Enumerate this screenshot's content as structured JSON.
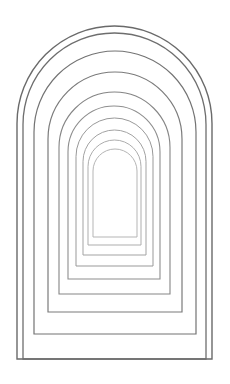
{
  "image": {
    "subject": "nested arches line illustration",
    "background": "#ffffff",
    "stroke_outer": "#6e6e6e",
    "stroke_inner": "#b5b5b5",
    "arches": [
      {
        "left": 17,
        "right": 212,
        "top": 26,
        "bottom": 359,
        "color": "#6a6a6a",
        "width": 1.4
      },
      {
        "left": 23,
        "right": 206,
        "top": 33,
        "bottom": 359,
        "color": "#6e6e6e",
        "width": 1.3
      },
      {
        "left": 34,
        "right": 196,
        "top": 51,
        "bottom": 334,
        "color": "#737373",
        "width": 1.2
      },
      {
        "left": 48,
        "right": 182,
        "top": 72,
        "bottom": 312,
        "color": "#7b7b7b",
        "width": 1.2
      },
      {
        "left": 59,
        "right": 170,
        "top": 92,
        "bottom": 294,
        "color": "#858585",
        "width": 1.1
      },
      {
        "left": 68,
        "right": 160,
        "top": 106,
        "bottom": 279,
        "color": "#8e8e8e",
        "width": 1.1
      },
      {
        "left": 76,
        "right": 153,
        "top": 118,
        "bottom": 266,
        "color": "#999999",
        "width": 1.0
      },
      {
        "left": 83,
        "right": 146,
        "top": 130,
        "bottom": 255,
        "color": "#a3a3a3",
        "width": 1.0
      },
      {
        "left": 88,
        "right": 141,
        "top": 140,
        "bottom": 245,
        "color": "#adadad",
        "width": 1.0
      },
      {
        "left": 93,
        "right": 137,
        "top": 149,
        "bottom": 237,
        "color": "#b5b5b5",
        "width": 1.0
      }
    ]
  }
}
